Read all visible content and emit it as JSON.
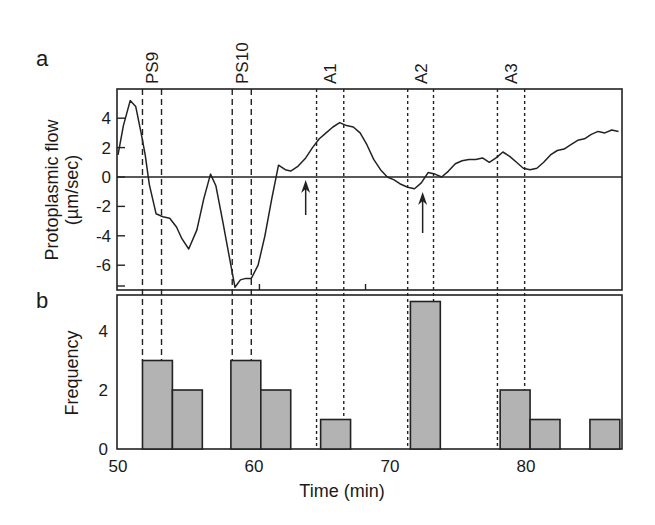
{
  "figure": {
    "panel_a_label": "a",
    "panel_b_label": "b",
    "events": [
      {
        "label": "PS9",
        "style": "dashed",
        "start_min": 51.8,
        "end_min": 53.2
      },
      {
        "label": "PS10",
        "style": "dashed",
        "start_min": 58.4,
        "end_min": 59.8
      },
      {
        "label": "A1",
        "style": "dotted",
        "start_min": 64.6,
        "end_min": 66.6
      },
      {
        "label": "A2",
        "style": "dotted",
        "start_min": 71.3,
        "end_min": 73.2
      },
      {
        "label": "A3",
        "style": "dotted",
        "start_min": 77.9,
        "end_min": 79.9
      }
    ],
    "arrows": [
      {
        "x_min": 63.8,
        "description": "upward arrow below zero line"
      },
      {
        "x_min": 72.4,
        "description": "upward arrow below zero line"
      }
    ]
  },
  "chart_data": [
    {
      "type": "line",
      "panel": "a",
      "title": "",
      "xlabel": "",
      "ylabel": "Protoplasmic flow (µm/sec)",
      "ylabel_line1": "Protoplasmic flow",
      "ylabel_line2": "(µm/sec)",
      "xlim": [
        50,
        87
      ],
      "ylim": [
        -7.5,
        6
      ],
      "y_ticks": [
        "4",
        "2",
        "0",
        "-2",
        "-4",
        "-6"
      ],
      "y_tick_values": [
        4,
        2,
        0,
        -2,
        -4,
        -6
      ],
      "zero_line": true,
      "grid": false,
      "series": [
        {
          "name": "Protoplasmic flow",
          "x": [
            50.0,
            50.4,
            50.9,
            51.3,
            51.7,
            52.0,
            52.3,
            52.8,
            53.3,
            53.8,
            54.3,
            54.7,
            55.2,
            55.8,
            56.3,
            56.8,
            57.2,
            57.7,
            58.2,
            58.6,
            59.0,
            59.4,
            59.8,
            60.3,
            60.8,
            61.3,
            61.8,
            62.3,
            62.7,
            63.2,
            63.8,
            64.3,
            64.8,
            65.3,
            65.8,
            66.3,
            66.8,
            67.3,
            67.8,
            68.3,
            68.8,
            69.3,
            69.8,
            70.3,
            70.8,
            71.3,
            71.8,
            72.3,
            72.8,
            73.3,
            73.8,
            74.3,
            74.8,
            75.3,
            75.8,
            76.3,
            76.8,
            77.3,
            77.8,
            78.3,
            78.8,
            79.3,
            79.8,
            80.3,
            80.8,
            81.3,
            81.8,
            82.3,
            82.8,
            83.3,
            83.8,
            84.3,
            84.8,
            85.3,
            85.8,
            86.3,
            86.8
          ],
          "y": [
            1.5,
            3.5,
            5.2,
            4.8,
            3.0,
            1.5,
            -0.5,
            -2.5,
            -2.7,
            -2.8,
            -3.4,
            -4.2,
            -4.9,
            -3.6,
            -1.5,
            0.2,
            -0.6,
            -3.0,
            -5.5,
            -7.5,
            -7.0,
            -6.9,
            -6.9,
            -6.0,
            -4.0,
            -1.5,
            0.8,
            0.5,
            0.4,
            0.7,
            1.3,
            2.0,
            2.6,
            3.0,
            3.4,
            3.7,
            3.5,
            3.4,
            3.0,
            2.2,
            1.2,
            0.5,
            0.0,
            -0.2,
            -0.5,
            -0.7,
            -0.8,
            -0.4,
            0.3,
            0.2,
            0.0,
            0.4,
            0.9,
            1.1,
            1.2,
            1.2,
            1.3,
            1.0,
            1.3,
            1.7,
            1.4,
            1.0,
            0.6,
            0.5,
            0.6,
            1.0,
            1.5,
            1.8,
            1.9,
            2.2,
            2.5,
            2.6,
            2.9,
            3.1,
            3.0,
            3.2,
            3.1
          ]
        }
      ]
    },
    {
      "type": "bar",
      "panel": "b",
      "title": "",
      "xlabel": "Time (min)",
      "ylabel": "Frequency",
      "xlim": [
        50,
        87
      ],
      "ylim": [
        0,
        5.2
      ],
      "x_ticks": [
        "50",
        "60",
        "70",
        "80"
      ],
      "x_tick_values": [
        50,
        60,
        70,
        80
      ],
      "y_ticks": [
        "0",
        "2",
        "4"
      ],
      "y_tick_values": [
        0,
        2,
        4
      ],
      "grid": false,
      "bin_width_min": 2.2,
      "bins": [
        {
          "start": 51.8,
          "end": 54.0,
          "value": 3
        },
        {
          "start": 54.0,
          "end": 56.2,
          "value": 2
        },
        {
          "start": 58.3,
          "end": 60.5,
          "value": 3
        },
        {
          "start": 60.5,
          "end": 62.7,
          "value": 2
        },
        {
          "start": 64.9,
          "end": 67.1,
          "value": 1
        },
        {
          "start": 71.5,
          "end": 73.7,
          "value": 5
        },
        {
          "start": 78.1,
          "end": 80.3,
          "value": 2
        },
        {
          "start": 80.3,
          "end": 82.5,
          "value": 1
        },
        {
          "start": 84.7,
          "end": 86.9,
          "value": 1
        }
      ],
      "categories": [
        "51.8-54.0",
        "54.0-56.2",
        "58.3-60.5",
        "60.5-62.7",
        "64.9-67.1",
        "71.5-73.7",
        "78.1-80.3",
        "80.3-82.5",
        "84.7-86.9"
      ],
      "values": [
        3,
        2,
        3,
        2,
        1,
        5,
        2,
        1,
        1
      ],
      "bar_color": "#b3b3b3"
    }
  ]
}
